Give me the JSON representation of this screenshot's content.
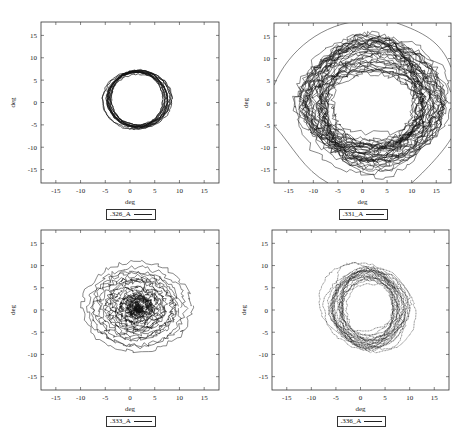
{
  "figure": {
    "panels": [
      {
        "id": "p1",
        "legend": ".326_A",
        "xlabel": "deg",
        "ylabel": "deg"
      },
      {
        "id": "p2",
        "legend": ".331_A",
        "xlabel": "deg",
        "ylabel": "deg"
      },
      {
        "id": "p3",
        "legend": ".333_A",
        "xlabel": "deg",
        "ylabel": "deg"
      },
      {
        "id": "p4",
        "legend": ".336_A",
        "xlabel": "deg",
        "ylabel": "deg"
      }
    ]
  },
  "chart_data": [
    {
      "type": "line",
      "title": "",
      "legend": [
        ".326_A"
      ],
      "xlabel": "deg",
      "ylabel": "deg",
      "xlim": [
        -18,
        18
      ],
      "ylim": [
        -18,
        18
      ],
      "xticks": [
        -15,
        -10,
        -5,
        0,
        5,
        10,
        15
      ],
      "yticks": [
        -15,
        -10,
        -5,
        0,
        5,
        10,
        15
      ],
      "grid": false,
      "legend_position": "below",
      "description": "Tight closed orbit (ring) of many overlapping loops",
      "center": [
        1.5,
        0.5
      ],
      "radius_x": [
        5.3,
        6.7
      ],
      "radius_y": [
        5.5,
        6.5
      ],
      "loops": 14,
      "noise": 0.15
    },
    {
      "type": "line",
      "title": "",
      "legend": [
        ".331_A"
      ],
      "xlabel": "deg",
      "ylabel": "deg",
      "xlim": [
        -18,
        18
      ],
      "ylim": [
        -18,
        18
      ],
      "xticks": [
        -15,
        -10,
        -5,
        0,
        5,
        10,
        15
      ],
      "yticks": [
        -15,
        -10,
        -5,
        0,
        5,
        10,
        15
      ],
      "grid": false,
      "legend_position": "below",
      "description": "Broad, noisy ring of many loops spanning roughly -13 to 17 deg",
      "center": [
        2,
        0
      ],
      "radius_x": [
        9,
        15
      ],
      "radius_y": [
        7,
        15.5
      ],
      "loops": 36,
      "noise": 0.7
    },
    {
      "type": "line",
      "title": "",
      "legend": [
        ".333_A"
      ],
      "xlabel": "deg",
      "ylabel": "deg",
      "xlim": [
        -18,
        18
      ],
      "ylim": [
        -18,
        18
      ],
      "xticks": [
        -15,
        -10,
        -5,
        0,
        5,
        10,
        15
      ],
      "yticks": [
        -15,
        -10,
        -5,
        0,
        5,
        10,
        15
      ],
      "grid": false,
      "legend_position": "below",
      "description": "Spiral converging from ~11 deg radius to a tight core near (1,0.5)",
      "center": [
        1.5,
        0.5
      ],
      "radius_x": [
        0.5,
        11
      ],
      "radius_y": [
        0.5,
        10
      ],
      "loops": 22,
      "noise": 0.55
    },
    {
      "type": "line",
      "title": "",
      "legend": [
        ".336_A"
      ],
      "xlabel": "deg",
      "ylabel": "deg",
      "xlim": [
        -18,
        18
      ],
      "ylim": [
        -18,
        18
      ],
      "xticks": [
        -15,
        -10,
        -5,
        0,
        5,
        10,
        15
      ],
      "yticks": [
        -15,
        -10,
        -5,
        0,
        5,
        10,
        15
      ],
      "grid": false,
      "legend_position": "below",
      "description": "Dense ring with rotating elliptical outer loops (dotted trace), extending to ~10 deg",
      "center": [
        1.5,
        0.5
      ],
      "radius_x": [
        4.5,
        8
      ],
      "radius_y": [
        5,
        9.5
      ],
      "loops": 24,
      "noise": 0.25
    }
  ]
}
